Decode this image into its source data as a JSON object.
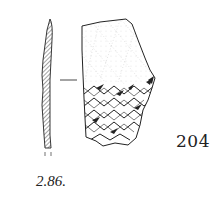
{
  "figure": {
    "catalogue_number": "204",
    "figure_label": "2.86.",
    "colors": {
      "ink": "#222222",
      "background": "#ffffff"
    }
  }
}
